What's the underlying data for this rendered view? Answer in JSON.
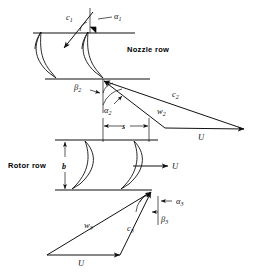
{
  "figure": {
    "type": "engineering-diagram"
  },
  "labels": {
    "nozzle_row": "Nozzle row",
    "rotor_row": "Rotor row",
    "pitch": "s",
    "blade_height": "b",
    "c1": "c",
    "c1_sub": "1",
    "alpha1": "α",
    "alpha1_sub": "1",
    "beta2": "β",
    "beta2_sub": "2",
    "alpha2": "α",
    "alpha2_sub": "2",
    "c2": "c",
    "c2_sub": "2",
    "w2": "w",
    "w2_sub": "2",
    "u_top": "U",
    "u_mid": "U",
    "u_bottom": "U",
    "w3": "w",
    "w3_sub": "3",
    "c3": "c",
    "c3_sub": "3",
    "alpha3": "α",
    "alpha3_sub": "3",
    "beta3": "β",
    "beta3_sub": "3"
  },
  "colors": {
    "line": "#111111",
    "background": "#ffffff",
    "text": "#000000"
  },
  "geometry": {
    "nozzle_inlet_line_y": 33,
    "nozzle_outlet_line_y": 79,
    "rotor_inlet_line_y": 140,
    "rotor_outlet_line_y": 190,
    "pitch_s_px": 46,
    "blade_height_b_px": 50
  }
}
